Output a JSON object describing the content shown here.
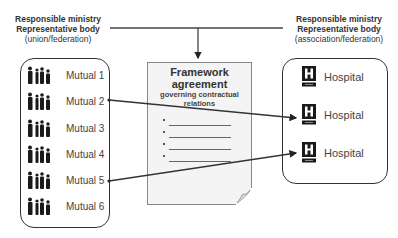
{
  "diagram": {
    "left_header": {
      "line1": "Responsible ministry",
      "line2": "Representative body",
      "line3": "(union/federation)"
    },
    "right_header": {
      "line1": "Responsible ministry",
      "line2": "Representative body",
      "line3": "(association/federation)"
    },
    "document": {
      "title_line1": "Framework",
      "title_line2": "agreement",
      "subtitle_line1": "governing contractual",
      "subtitle_line2": "relations",
      "bullet_count": 4
    },
    "mutuals": [
      {
        "label": "Mutual 1",
        "icon": "family-icon"
      },
      {
        "label": "Mutual 2",
        "icon": "family-icon"
      },
      {
        "label": "Mutual 3",
        "icon": "family-icon"
      },
      {
        "label": "Mutual 4",
        "icon": "family-icon"
      },
      {
        "label": "Mutual 5",
        "icon": "family-icon"
      },
      {
        "label": "Mutual 6",
        "icon": "family-icon"
      }
    ],
    "hospitals": [
      {
        "label": "Hospital",
        "icon": "hospital-icon"
      },
      {
        "label": "Hospital",
        "icon": "hospital-icon"
      },
      {
        "label": "Hospital",
        "icon": "hospital-icon"
      }
    ],
    "connections": [
      {
        "from": "Mutual 2",
        "to": "Hospital 2"
      },
      {
        "from": "Mutual 5",
        "to": "Hospital 3"
      }
    ],
    "colors": {
      "line": "#333333",
      "document_fill": "#f4f4f4",
      "icon": "#1a1a1a"
    }
  }
}
